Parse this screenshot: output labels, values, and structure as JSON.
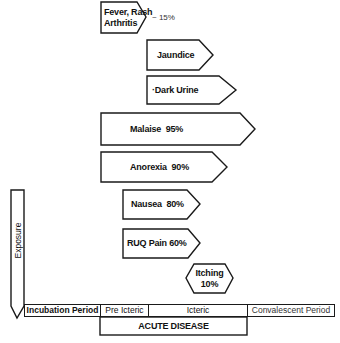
{
  "diagram": {
    "type": "clinical-course-of-hepatitis",
    "symptoms": [
      {
        "id": "fever",
        "line1": "Fever, Rash",
        "line2": "Arthritis",
        "annotation": "~ 15%"
      },
      {
        "id": "jaundice",
        "label": "Jaundice"
      },
      {
        "id": "dark-urine",
        "label": "·Dark Urine"
      },
      {
        "id": "malaise",
        "label": "Malaise  95%"
      },
      {
        "id": "anorexia",
        "label": "Anorexia  90%"
      },
      {
        "id": "nausea",
        "label": "Nausea  80%"
      },
      {
        "id": "ruq-pain",
        "label": "RUQ Pain 60%"
      },
      {
        "id": "itching",
        "line1": "Itching",
        "line2": "10%"
      }
    ],
    "exposure": {
      "label": "Exposure"
    },
    "timeline": {
      "periods": [
        {
          "label": "Incubation Period"
        },
        {
          "label": "Pre Icteric"
        },
        {
          "label": "Icteric"
        },
        {
          "label": "Convalescent Period"
        }
      ],
      "acute_disease": "ACUTE DISEASE"
    }
  }
}
